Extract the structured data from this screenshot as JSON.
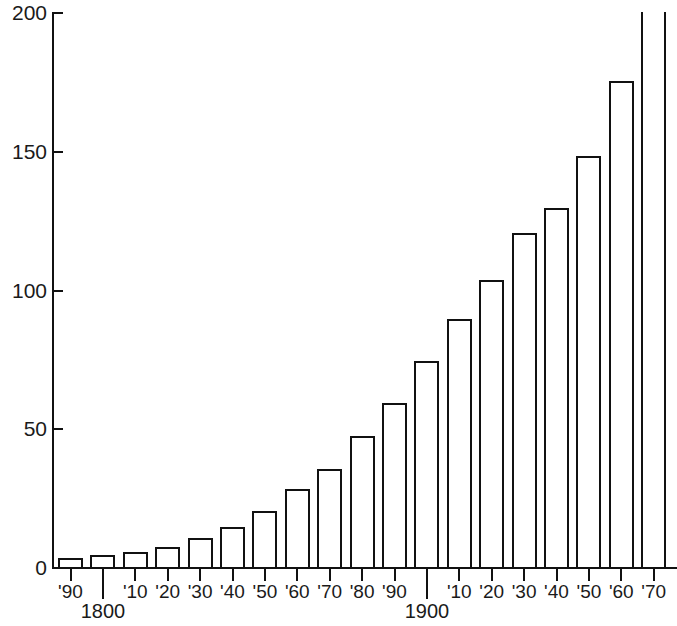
{
  "chart_data": {
    "type": "bar",
    "title": "",
    "subtitle": "",
    "xlabel": "",
    "ylabel": "",
    "grid": false,
    "legend": null,
    "ylim": [
      0,
      200
    ],
    "y_ticks": [
      0,
      50,
      100,
      150,
      200
    ],
    "y_tick_labels": [
      "0",
      "50",
      "100",
      "150",
      "200"
    ],
    "categories": [
      "1790",
      "1800",
      "1810",
      "1820",
      "1830",
      "1840",
      "1850",
      "1860",
      "1870",
      "1880",
      "1890",
      "1900",
      "1910",
      "1920",
      "1930",
      "1940",
      "1950",
      "1960",
      "1970"
    ],
    "x_tick_labels": [
      "'90",
      "",
      "'10",
      "'20",
      "'30",
      "'40",
      "'50",
      "'60",
      "'70",
      "'80",
      "'90",
      "",
      "'10",
      "'20",
      "'30",
      "'40",
      "'50",
      "'60",
      "'70"
    ],
    "century_markers": [
      {
        "label": "1800",
        "index": 1
      },
      {
        "label": "1900",
        "index": 11
      }
    ],
    "values": [
      4,
      5,
      6,
      8,
      11,
      15,
      21,
      29,
      36,
      48,
      60,
      75,
      90,
      104,
      121,
      130,
      149,
      176,
      203
    ],
    "clipped_last_bar": true,
    "colors": {
      "bar_fill": "#ffffff",
      "bar_stroke": "#111111",
      "axis": "#111111",
      "text": "#1a1a1a",
      "background": "#ffffff"
    }
  }
}
